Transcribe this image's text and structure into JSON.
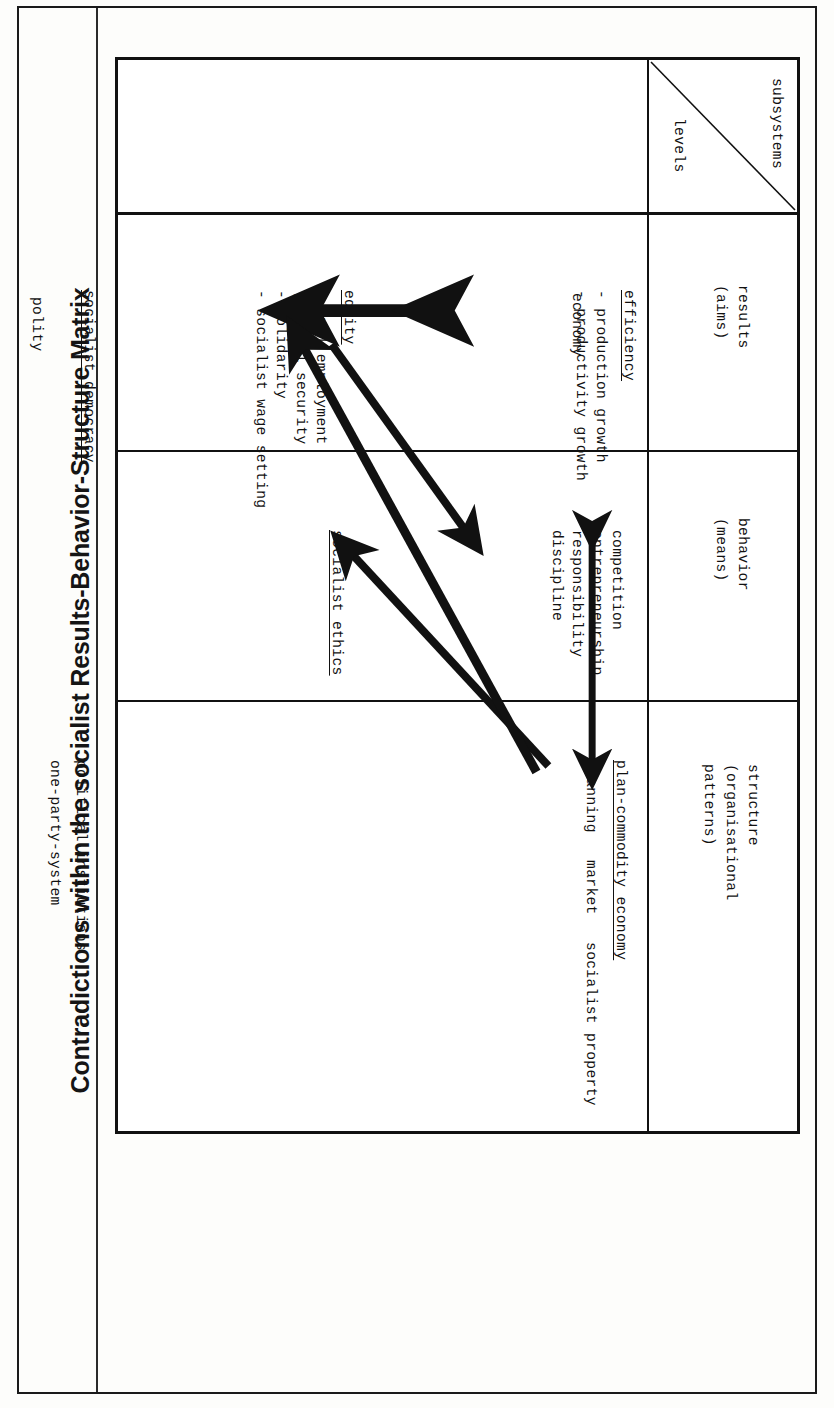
{
  "document": {
    "title": "Contradictions within the socialist Results-Behavior-Structure Matrix"
  },
  "matrix": {
    "corner": {
      "top_label": "subsystems",
      "bottom_label": "levels"
    },
    "columns": [
      {
        "key": "economy",
        "label": "economy"
      },
      {
        "key": "society",
        "label": "society"
      },
      {
        "key": "polity",
        "label": "polity"
      }
    ],
    "rows": [
      {
        "key": "results",
        "label_line1": "results",
        "label_line2": "(aims)"
      },
      {
        "key": "behavior",
        "label_line1": "behavior",
        "label_line2": "(means)"
      },
      {
        "key": "structure",
        "label_line1": "structure",
        "label_line2": "(organisational",
        "label_line3": "patterns)"
      }
    ],
    "cells": {
      "results_economy": {
        "heading": "efficiency",
        "heading_underlined": true,
        "items": [
          "- production growth",
          "- productivity growth"
        ]
      },
      "results_society": {
        "heading": "equity",
        "heading_underlined": true,
        "items": [
          "- full employment",
          "- social security",
          "- solidarity",
          "- socialist wage setting"
        ]
      },
      "results_polity": {
        "heading": "socialist democracy",
        "heading_underlined": true,
        "items": []
      },
      "behavior_economy": {
        "heading": "",
        "heading_underlined": false,
        "items": [
          "competition",
          "entrepreneurship",
          "responsibility",
          "discipline"
        ]
      },
      "behavior_society": {
        "heading": "socialist ethics",
        "heading_underlined": true,
        "items": []
      },
      "behavior_polity": {
        "heading": "",
        "heading_underlined": false,
        "items": []
      },
      "structure_economy": {
        "heading": "plan-commodity economy",
        "heading_underlined": true,
        "items": [
          "planning   market   socialist property"
        ]
      },
      "structure_society": {
        "heading": "",
        "heading_underlined": false,
        "items": []
      },
      "structure_polity": {
        "heading": "",
        "heading_underlined": false,
        "items": [
          "political instiutions",
          "one-party-system"
        ]
      }
    },
    "arrows": [
      {
        "name": "efficiency-equity-tension",
        "style": "double-headed-vertical",
        "from": "efficiency",
        "to": "equity"
      },
      {
        "name": "behavior-structure-economy",
        "style": "double-headed-horizontal",
        "from": "competition-block",
        "to": "planning"
      },
      {
        "name": "market-to-socialist-ethics",
        "style": "single-headed-diagonal",
        "from": "market",
        "to": "socialist-ethics"
      },
      {
        "name": "market-to-equity",
        "style": "single-headed-diagonal",
        "from": "market",
        "to": "equity"
      },
      {
        "name": "equity-to-competition",
        "style": "single-headed-diagonal",
        "from": "equity",
        "to": "competition-block"
      }
    ]
  },
  "colors": {
    "ink": "#111111",
    "paper": "#ffffff",
    "page_background": "#fdfdfb"
  }
}
